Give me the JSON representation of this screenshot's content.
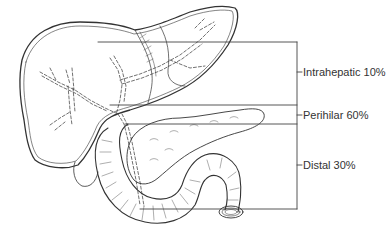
{
  "figure": {
    "type": "anatomical-diagram",
    "colors": {
      "line": "#333333",
      "background": "#ffffff"
    }
  },
  "labels": [
    {
      "id": "intrahepatic",
      "text": "Intrahepatic 10%",
      "region": "Intrahepatic",
      "percent": "10%"
    },
    {
      "id": "perihilar",
      "text": "Perihilar 60%",
      "region": "Perihilar",
      "percent": "60%"
    },
    {
      "id": "distal",
      "text": "Distal 30%",
      "region": "Distal",
      "percent": "30%"
    }
  ]
}
